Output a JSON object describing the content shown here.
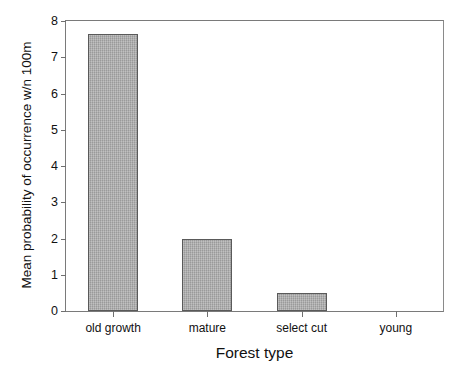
{
  "chart_data": {
    "type": "bar",
    "title": "",
    "xlabel": "Forest type",
    "ylabel": "Mean probability of occurrence w/n 100m",
    "categories": [
      "old growth",
      "mature",
      "select cut",
      "young"
    ],
    "values": [
      7.65,
      2.0,
      0.5,
      0.0
    ],
    "ylim": [
      0,
      8
    ],
    "yticks": [
      0,
      1,
      2,
      3,
      4,
      5,
      6,
      7,
      8
    ],
    "ytick_labels": [
      "0",
      "1",
      "2",
      "3",
      "4",
      "5",
      "6",
      "7",
      "8"
    ],
    "grid": false,
    "legend": null,
    "series": [
      {
        "name": "Mean probability of occurrence w/n 100m",
        "values": [
          7.65,
          2.0,
          0.5,
          0.0
        ]
      }
    ],
    "bar_fill_color": "#a9a9a9",
    "bar_edge_color": "#5a5a5a",
    "axis_color": "#7a7a7a",
    "background_color": "#ffffff"
  }
}
